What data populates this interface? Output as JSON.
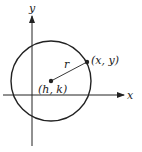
{
  "diagram": {
    "type": "circle-on-coordinate-plane",
    "axes": {
      "x_label": "x",
      "y_label": "y"
    },
    "center": {
      "label": "(h, k)"
    },
    "point_on_circle": {
      "label": "(x, y)"
    },
    "radius": {
      "label": "r"
    },
    "colors": {
      "stroke": "#222222",
      "background": "#ffffff"
    }
  }
}
